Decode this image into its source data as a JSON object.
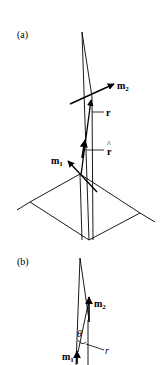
{
  "figure": {
    "panel_a": {
      "label": "(a)",
      "vectors": {
        "m2": {
          "main": "m",
          "sub": "2"
        },
        "r": "r",
        "r_hat": "r",
        "r_hat_accent": "^",
        "m1": {
          "main": "m",
          "sub": "1"
        }
      }
    },
    "panel_b": {
      "label": "(b)",
      "vectors": {
        "m2": {
          "main": "m",
          "sub": "2"
        },
        "m1": {
          "main": "m",
          "sub": "1"
        },
        "theta": "θ",
        "r": "r"
      }
    },
    "colors": {
      "line": "#000000",
      "background": "#ffffff"
    }
  }
}
